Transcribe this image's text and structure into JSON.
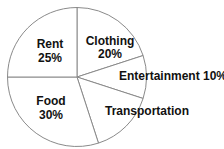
{
  "chart_data": {
    "type": "pie",
    "title": "",
    "categories": [
      "Rent",
      "Clothing",
      "Entertainment",
      "Transportation",
      "Food"
    ],
    "values": [
      25,
      20,
      10,
      15,
      30
    ],
    "value_labels": [
      "25%",
      "20%",
      "10%",
      "",
      "30%"
    ],
    "start_angle_deg": 0,
    "direction": "clockwise from top",
    "legend": "none",
    "colors": {
      "fill": "#ffffff",
      "stroke": "#8a8a8a",
      "text": "#111111"
    }
  },
  "labels": {
    "rent": {
      "name": "Rent",
      "value": "25%"
    },
    "clothing": {
      "name": "Clothing",
      "value": "20%"
    },
    "entertainment": {
      "name": "Entertainment 10%"
    },
    "transportation": {
      "name": "Transportation"
    },
    "food": {
      "name": "Food",
      "value": "30%"
    }
  }
}
